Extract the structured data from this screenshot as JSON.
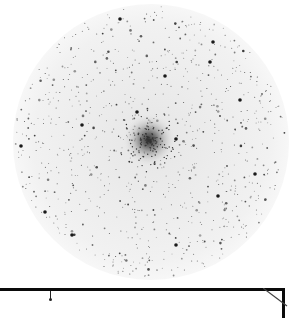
{
  "image": {
    "description": "Inverted (negative) astronomical image of a globular star cluster within a circular field of view",
    "background_color": "#ffffff",
    "field": {
      "center": [
        151,
        142
      ],
      "radius": 138,
      "fill_color": "#f2f2f2"
    },
    "cluster_core": {
      "center": [
        149,
        140
      ],
      "radius": 22,
      "color": "#555555"
    },
    "bright_stars": [
      [
        45,
        212
      ],
      [
        72,
        235
      ],
      [
        120,
        19
      ],
      [
        176,
        139
      ],
      [
        165,
        76
      ],
      [
        213,
        42
      ],
      [
        255,
        174
      ],
      [
        218,
        196
      ],
      [
        176,
        245
      ],
      [
        21,
        146
      ],
      [
        82,
        125
      ],
      [
        137,
        112
      ],
      [
        210,
        62
      ],
      [
        240,
        100
      ]
    ],
    "frame": {
      "color": "#0a0a0a",
      "top_y": 288
    }
  }
}
